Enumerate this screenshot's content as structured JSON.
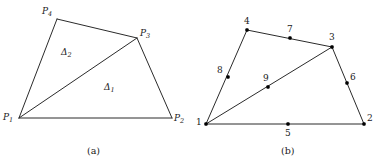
{
  "figure": {
    "background": "#ffffff",
    "stroke_color": "#2b2b2b",
    "node_color": "#000000",
    "panels": [
      {
        "id": "panel-a",
        "caption": "(a)",
        "caption_pos": {
          "x": 87,
          "y": 145
        },
        "description": "Quadrilateral P1 P2 P3 P4 split by diagonal P1-P3 into triangles Delta 1 and Delta 2",
        "vertices": [
          {
            "name": "P1",
            "label": "P",
            "subscript": "1",
            "x": 19,
            "y": 118,
            "label_x": 3,
            "label_y": 112
          },
          {
            "name": "P2",
            "label": "P",
            "subscript": "2",
            "x": 172,
            "y": 118,
            "label_x": 174,
            "label_y": 113
          },
          {
            "name": "P3",
            "label": "P",
            "subscript": "3",
            "x": 137,
            "y": 38,
            "label_x": 140,
            "label_y": 28
          },
          {
            "name": "P4",
            "label": "P",
            "subscript": "4",
            "x": 57,
            "y": 19,
            "label_x": 42,
            "label_y": 6
          }
        ],
        "edges": [
          {
            "from": "P1",
            "to": "P2"
          },
          {
            "from": "P2",
            "to": "P3"
          },
          {
            "from": "P3",
            "to": "P4"
          },
          {
            "from": "P4",
            "to": "P1"
          },
          {
            "from": "P1",
            "to": "P3"
          }
        ],
        "regions": [
          {
            "name": "triangle-delta-1",
            "label": "Δ",
            "subscript": "1",
            "label_x": 104,
            "label_y": 82
          },
          {
            "name": "triangle-delta-2",
            "label": "Δ",
            "subscript": "2",
            "label_x": 61,
            "label_y": 47
          }
        ]
      },
      {
        "id": "panel-b",
        "caption": "(b)",
        "caption_pos": {
          "x": 281,
          "y": 145
        },
        "description": "Same quadrilateral meshed with 9 numbered nodes: 4 corners, 4 edge midpoints and 1 diagonal midpoint",
        "vertices": [
          {
            "name": "node-1",
            "label": "1",
            "x": 206,
            "y": 124,
            "label_x": 196,
            "label_y": 117
          },
          {
            "name": "node-2",
            "label": "2",
            "x": 364,
            "y": 124,
            "label_x": 367,
            "label_y": 113
          },
          {
            "name": "node-3",
            "label": "3",
            "x": 332,
            "y": 47,
            "label_x": 329,
            "label_y": 32
          },
          {
            "name": "node-4",
            "label": "4",
            "x": 247,
            "y": 30,
            "label_x": 244,
            "label_y": 16
          },
          {
            "name": "node-5",
            "label": "5",
            "x": 288,
            "y": 124,
            "label_x": 285,
            "label_y": 128
          },
          {
            "name": "node-6",
            "label": "6",
            "x": 347,
            "y": 83,
            "label_x": 350,
            "label_y": 72
          },
          {
            "name": "node-7",
            "label": "7",
            "x": 290,
            "y": 38,
            "label_x": 287,
            "label_y": 24
          },
          {
            "name": "node-8",
            "label": "8",
            "x": 228,
            "y": 77,
            "label_x": 217,
            "label_y": 65
          },
          {
            "name": "node-9",
            "label": "9",
            "x": 268,
            "y": 87,
            "label_x": 263,
            "label_y": 73
          }
        ],
        "edges": [
          {
            "from": "node-1",
            "to": "node-2"
          },
          {
            "from": "node-2",
            "to": "node-3"
          },
          {
            "from": "node-3",
            "to": "node-4"
          },
          {
            "from": "node-4",
            "to": "node-1"
          },
          {
            "from": "node-1",
            "to": "node-3"
          }
        ]
      }
    ]
  }
}
